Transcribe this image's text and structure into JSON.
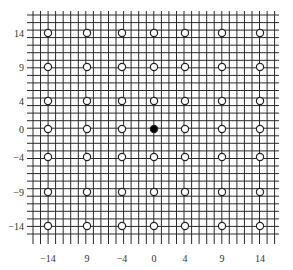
{
  "chart_data": {
    "type": "scatter",
    "title": "",
    "xlabel": "",
    "ylabel": "",
    "grid": true,
    "x_tick_labels": [
      "-14",
      "9",
      "-4",
      "0",
      "4",
      "9",
      "14"
    ],
    "y_tick_labels": [
      "14",
      "9",
      "4",
      "0",
      "-4",
      "-9",
      "-14"
    ],
    "x_tick_values": [
      -14,
      -9,
      -4,
      0,
      4,
      9,
      14
    ],
    "y_tick_values": [
      14,
      9,
      4,
      0,
      -4,
      -9,
      -14
    ],
    "series": [
      {
        "name": "lattice points",
        "marker": "open-circle",
        "points": "all combinations of x in [-14,-9,-4,0,4,9,14] and y in [14,9,4,0,-4,-9,-14] except (0,0)"
      },
      {
        "name": "origin",
        "marker": "filled-circle",
        "points": [
          [
            0,
            0
          ]
        ]
      }
    ],
    "colors": {
      "grid": "#222222",
      "marker_fill_open": "#ffffff",
      "marker_fill_closed": "#000000"
    }
  }
}
